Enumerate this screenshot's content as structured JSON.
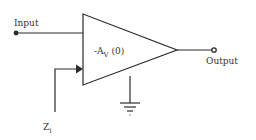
{
  "diagram": {
    "type": "inverting-amplifier-block",
    "labels": {
      "input": "Input",
      "output": "Output",
      "gain_prefix": "-A",
      "gain_sub": "V",
      "gain_suffix": " (0)",
      "impedance": "Z",
      "impedance_sub": "i"
    },
    "colors": {
      "line": "#2a2a2a",
      "text": "#333333",
      "background": "#ffffff"
    }
  }
}
